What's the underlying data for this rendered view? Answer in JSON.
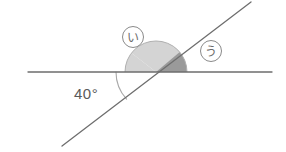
{
  "diagram": {
    "background_color": "#ffffff",
    "line_color": "#6e6e6e",
    "arc_stroke_color": "#9a9a9a",
    "label_text_color": "#6b6b6b",
    "angle_text_color": "#5a5a5a",
    "fill_light_color": "#d4d4d4",
    "fill_dark_color": "#9a9a9a",
    "known_angle": {
      "name": "forty-degree-angle",
      "value": "40",
      "unit": "°",
      "label": "40°",
      "description": "angle between horizontal line and diagonal line, measured below-left"
    },
    "unknown_angles": [
      {
        "name": "angle-i",
        "glyph": "い",
        "romaji": "i",
        "shade": "light",
        "fill_color": "#d4d4d4",
        "description": "left portion of the half-disc above the horizontal line"
      },
      {
        "name": "angle-u",
        "glyph": "う",
        "romaji": "u",
        "shade": "dark",
        "fill_color": "#9a9a9a",
        "description": "right portion of the half-disc above the horizontal line"
      }
    ],
    "lines": [
      {
        "name": "horizontal-line",
        "x1": 28,
        "y1": 72,
        "x2": 272,
        "y2": 72
      },
      {
        "name": "diagonal-line",
        "x1": 62,
        "y1": 146,
        "x2": 251,
        "y2": 2
      }
    ],
    "intersection_point": {
      "x": 156,
      "y": 72
    },
    "half_disc_radius": 31,
    "arc_40_radius": 40
  }
}
